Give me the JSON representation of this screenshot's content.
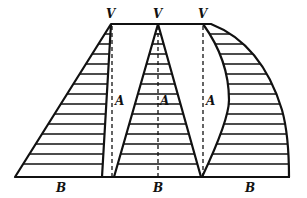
{
  "diagram": {
    "labels": {
      "vertex": "V",
      "axis": "A",
      "base": "B"
    },
    "shapes": [
      {
        "name": "left-right-triangle",
        "vertex_label": "V",
        "axis_label": "A",
        "base_label": "B"
      },
      {
        "name": "middle-isosceles-triangle",
        "vertex_label": "V",
        "axis_label": "A",
        "base_label": "B"
      },
      {
        "name": "right-curved-shape",
        "vertex_label": "V",
        "axis_label": "A",
        "base_label": "B"
      }
    ]
  }
}
